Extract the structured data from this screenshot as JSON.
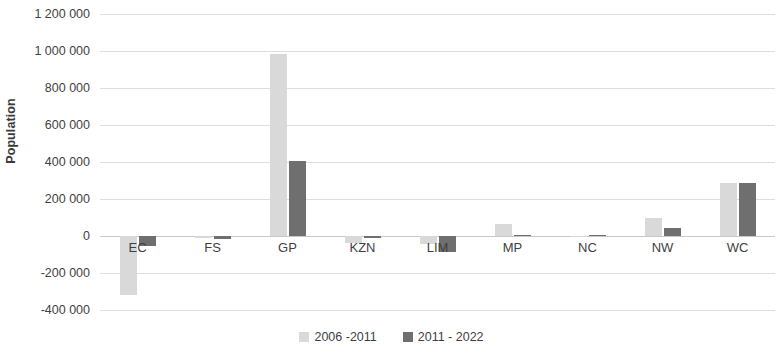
{
  "chart_data": {
    "type": "bar",
    "title": "",
    "subtitle": "",
    "xlabel": "",
    "ylabel": "Population",
    "categories": [
      "EC",
      "FS",
      "GP",
      "KZN",
      "LIM",
      "MP",
      "NC",
      "NW",
      "WC"
    ],
    "series": [
      {
        "name": "2006 -2011",
        "color": "#d9d9d9",
        "values": [
          -320000,
          -12000,
          985000,
          -38000,
          -45000,
          65000,
          -4000,
          95000,
          285000
        ]
      },
      {
        "name": "2011 - 2022",
        "color": "#6f6f6f",
        "values": [
          -55000,
          -16000,
          405000,
          -10000,
          -88000,
          6000,
          3000,
          45000,
          285000
        ]
      }
    ],
    "ylim": [
      -400000,
      1200000
    ],
    "ytick_values": [
      1200000,
      1000000,
      800000,
      600000,
      400000,
      200000,
      0,
      -200000,
      -400000
    ],
    "ytick_labels": [
      "1 200 000",
      "1 000 000",
      "800 000",
      "600 000",
      "400 000",
      "200 000",
      "0",
      "-200 000",
      "-400 000"
    ],
    "grid": true,
    "legend_position": "bottom"
  }
}
